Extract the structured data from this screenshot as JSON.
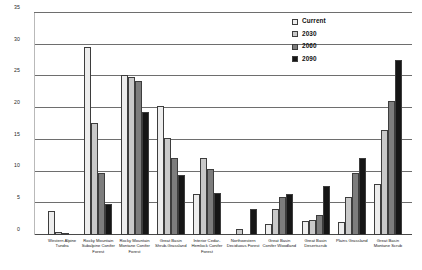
{
  "chart_data": {
    "type": "bar",
    "title": "",
    "xlabel": "",
    "ylabel": "",
    "ylim": [
      0,
      35
    ],
    "yticks": [
      0,
      5,
      10,
      15,
      20,
      25,
      30,
      35
    ],
    "grid": true,
    "legend_position": "top-right",
    "categories": [
      "Western Alpine Tundra",
      "Rocky Mountain Subalpine Conifer Forest",
      "Rocky Mountain Montane Conifer Forest",
      "Great Basin Shrub-Grassland",
      "Interior Cedar-Hemlock Conifer Forest",
      "Northwestern Deciduous Forest",
      "Great Basin Conifer Woodland",
      "Great Basin Desertscrub",
      "Plains Grassland",
      "Great Basin Montane Scrub"
    ],
    "series": [
      {
        "name": "Current",
        "color": "#ededed",
        "values": [
          3.8,
          29.7,
          25.3,
          20.4,
          6.5,
          0,
          1.8,
          2.2,
          2.1,
          8.0
        ]
      },
      {
        "name": "2030",
        "color": "#c9c9c9",
        "values": [
          0.5,
          17.7,
          24.9,
          15.3,
          12.2,
          1.0,
          4.1,
          2.3,
          6.0,
          16.5
        ]
      },
      {
        "name": "2060",
        "color": "#7d7d7d",
        "values": [
          0.15,
          9.8,
          24.3,
          12.2,
          10.4,
          0,
          6.0,
          3.2,
          9.8,
          21.1
        ]
      },
      {
        "name": "2090",
        "color": "#161616",
        "values": [
          0,
          4.9,
          19.4,
          9.4,
          6.7,
          4.1,
          6.5,
          7.8,
          12.1,
          27.6
        ]
      }
    ]
  },
  "legend": {
    "items": [
      {
        "label": "Current"
      },
      {
        "label": "2030"
      },
      {
        "label": "2060"
      },
      {
        "label": "2090"
      }
    ]
  }
}
